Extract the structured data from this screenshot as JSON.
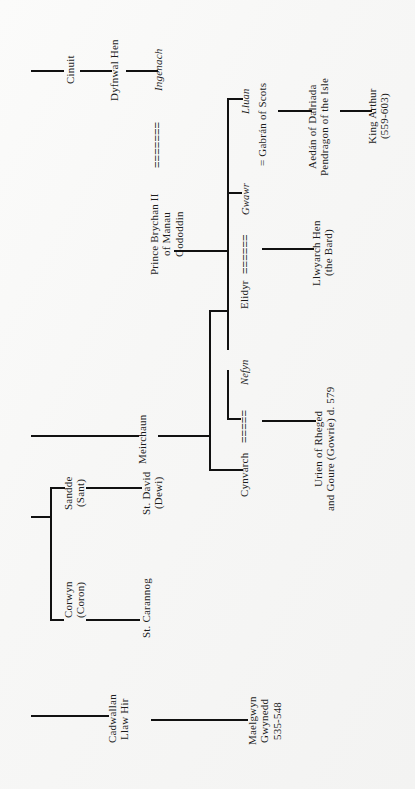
{
  "document": {
    "kind": "genealogical-chart",
    "orientation": "rotated-90-ccw",
    "background_color": "#f7f7f6",
    "ink_color": "#111111"
  },
  "people": {
    "cinuit": "Cinuit",
    "dyfnwal_hen": "Dyfnwal Hen",
    "ingenach": "Ingenach",
    "prince_brychan": "Prince Brychan II\nof Manau\nGododdin",
    "lluan": "Lluan",
    "gabran": "= Gabrán of Scots",
    "aedan": "Aedán of Dalriada\nPendragon of the Isle",
    "king_arthur": "King Arthur\n(559-603)",
    "gwawr": "Gwawr",
    "elidyr": "Elidyr",
    "llwyarch_hen": "Llwyarch Hen\n(the Bard)",
    "meirchaun": "Meirchaun",
    "nefyn": "Nefyn",
    "cynvarch": "Cynvarch",
    "urien": "Urien of Rheged\nand Goure (Gowrie) d. 579",
    "sandde": "Sandde\n(Sant)",
    "st_david": "St. David\n(Dewi)",
    "corwyn": "Corwyn\n(Coron)",
    "st_carannog": "St. Carannog",
    "cadwallan": "Cadwallan\nLlaw Hir",
    "maelgwyn": "Maelgwyn\nGwynedd\n535-548"
  },
  "marriage_marks": {
    "ingenach_brychan": "=======",
    "elidyr_gwawr": "======",
    "cynvarch_nefyn": "=====",
    "symbol_name": "marriage-bar"
  }
}
